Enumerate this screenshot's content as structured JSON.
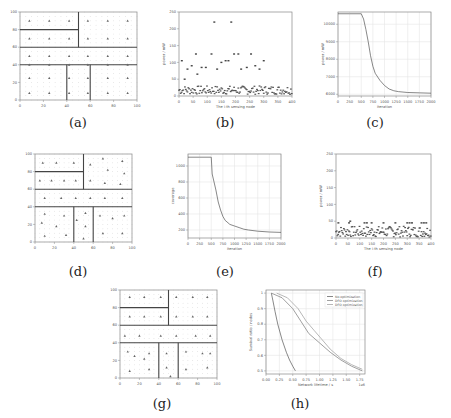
{
  "captions": {
    "a": "(a)",
    "b": "(b)",
    "c": "(c)",
    "d": "(d)",
    "e": "(e)",
    "f": "(f)",
    "g": "(g)",
    "h": "(h)"
  },
  "chart_data": [
    {
      "id": "a",
      "type": "scatter",
      "title": "",
      "xlabel": "",
      "ylabel": "",
      "xlim": [
        0,
        100
      ],
      "ylim": [
        0,
        100
      ],
      "x_ticks": [
        0,
        20,
        40,
        60,
        80,
        100
      ],
      "y_ticks": [
        0,
        20,
        40,
        60,
        80,
        100
      ],
      "grid": "dotted",
      "partition_lines": [
        [
          [
            0,
            60
          ],
          [
            100,
            60
          ]
        ],
        [
          [
            0,
            40
          ],
          [
            100,
            40
          ]
        ],
        [
          [
            50,
            60
          ],
          [
            50,
            100
          ]
        ],
        [
          [
            0,
            80
          ],
          [
            50,
            80
          ]
        ],
        [
          [
            40,
            0
          ],
          [
            40,
            40
          ]
        ],
        [
          [
            60,
            0
          ],
          [
            60,
            40
          ]
        ]
      ],
      "points": [
        [
          8,
          90
        ],
        [
          25,
          90
        ],
        [
          42,
          90
        ],
        [
          58,
          90
        ],
        [
          75,
          90
        ],
        [
          92,
          90
        ],
        [
          8,
          70
        ],
        [
          25,
          70
        ],
        [
          42,
          70
        ],
        [
          58,
          70
        ],
        [
          75,
          70
        ],
        [
          92,
          70
        ],
        [
          8,
          50
        ],
        [
          25,
          50
        ],
        [
          42,
          50
        ],
        [
          58,
          50
        ],
        [
          75,
          50
        ],
        [
          92,
          50
        ],
        [
          8,
          40
        ],
        [
          25,
          40
        ],
        [
          42,
          40
        ],
        [
          58,
          40
        ],
        [
          75,
          40
        ],
        [
          92,
          40
        ],
        [
          8,
          25
        ],
        [
          25,
          25
        ],
        [
          42,
          25
        ],
        [
          58,
          25
        ],
        [
          75,
          25
        ],
        [
          92,
          25
        ],
        [
          8,
          8
        ],
        [
          25,
          8
        ],
        [
          42,
          8
        ],
        [
          58,
          8
        ],
        [
          75,
          8
        ],
        [
          92,
          8
        ]
      ]
    },
    {
      "id": "b",
      "type": "scatter",
      "title": "",
      "xlabel": "The i-th sensing node",
      "ylabel": "power / mW",
      "xlim": [
        0,
        400
      ],
      "ylim": [
        0,
        250
      ],
      "x_ticks": [
        0,
        50,
        100,
        150,
        200,
        250,
        300,
        350,
        400
      ],
      "y_ticks": [
        0,
        50,
        100,
        150,
        200,
        250
      ],
      "grid": false,
      "highlights": [
        [
          10,
          105
        ],
        [
          20,
          50
        ],
        [
          30,
          80
        ],
        [
          45,
          90
        ],
        [
          60,
          125
        ],
        [
          65,
          65
        ],
        [
          80,
          85
        ],
        [
          95,
          85
        ],
        [
          115,
          125
        ],
        [
          125,
          220
        ],
        [
          135,
          80
        ],
        [
          150,
          100
        ],
        [
          165,
          105
        ],
        [
          175,
          105
        ],
        [
          185,
          220
        ],
        [
          195,
          125
        ],
        [
          210,
          125
        ],
        [
          220,
          80
        ],
        [
          240,
          85
        ],
        [
          255,
          125
        ],
        [
          270,
          90
        ],
        [
          285,
          80
        ],
        [
          300,
          105
        ]
      ],
      "baseline_band": [
        5,
        30
      ]
    },
    {
      "id": "c",
      "type": "line",
      "title": "",
      "xlabel": "Iteration",
      "ylabel": "power / mW",
      "xlim": [
        0,
        2000
      ],
      "ylim": [
        5900,
        10700
      ],
      "x_ticks": [
        0,
        250,
        500,
        750,
        1000,
        1250,
        1500,
        1750,
        2000
      ],
      "y_ticks": [
        6000,
        7000,
        8000,
        9000,
        10000
      ],
      "grid": true,
      "x": [
        0,
        250,
        500,
        550,
        600,
        650,
        700,
        750,
        800,
        900,
        1000,
        1100,
        1200,
        1300,
        1500,
        1750,
        2000
      ],
      "values": [
        10600,
        10600,
        10600,
        10300,
        9700,
        9000,
        8200,
        7600,
        7200,
        6800,
        6500,
        6300,
        6200,
        6150,
        6100,
        6080,
        6060
      ]
    },
    {
      "id": "d",
      "type": "scatter",
      "title": "",
      "xlabel": "",
      "ylabel": "",
      "xlim": [
        0,
        100
      ],
      "ylim": [
        0,
        100
      ],
      "x_ticks": [
        0,
        20,
        40,
        60,
        80,
        100
      ],
      "y_ticks": [
        0,
        20,
        40,
        60,
        80,
        100
      ],
      "grid": "dotted",
      "partition_lines": [
        [
          [
            0,
            60
          ],
          [
            100,
            60
          ]
        ],
        [
          [
            0,
            40
          ],
          [
            100,
            40
          ]
        ],
        [
          [
            50,
            60
          ],
          [
            50,
            100
          ]
        ],
        [
          [
            0,
            80
          ],
          [
            50,
            80
          ]
        ],
        [
          [
            40,
            0
          ],
          [
            40,
            40
          ]
        ],
        [
          [
            60,
            0
          ],
          [
            60,
            40
          ]
        ]
      ],
      "points": [
        [
          8,
          90
        ],
        [
          22,
          90
        ],
        [
          40,
          90
        ],
        [
          57,
          88
        ],
        [
          70,
          95
        ],
        [
          75,
          82
        ],
        [
          90,
          92
        ],
        [
          92,
          78
        ],
        [
          88,
          66
        ],
        [
          5,
          70
        ],
        [
          17,
          70
        ],
        [
          30,
          70
        ],
        [
          42,
          70
        ],
        [
          57,
          70
        ],
        [
          72,
          67
        ],
        [
          10,
          50
        ],
        [
          27,
          50
        ],
        [
          42,
          50
        ],
        [
          57,
          50
        ],
        [
          72,
          50
        ],
        [
          90,
          50
        ],
        [
          10,
          32
        ],
        [
          7,
          22
        ],
        [
          22,
          18
        ],
        [
          30,
          30
        ],
        [
          10,
          7
        ],
        [
          32,
          8
        ],
        [
          43,
          25
        ],
        [
          52,
          33
        ],
        [
          52,
          18
        ],
        [
          50,
          4
        ],
        [
          67,
          30
        ],
        [
          70,
          10
        ],
        [
          80,
          27
        ],
        [
          92,
          30
        ],
        [
          90,
          10
        ]
      ]
    },
    {
      "id": "e",
      "type": "line",
      "title": "",
      "xlabel": "Iteration",
      "ylabel": "coverage",
      "xlim": [
        0,
        2000
      ],
      "ylim": [
        100,
        1150
      ],
      "x_ticks": [
        0,
        250,
        500,
        750,
        1000,
        1250,
        1500,
        1750,
        2000
      ],
      "y_ticks": [
        200,
        400,
        600,
        800,
        1000
      ],
      "grid": true,
      "x": [
        0,
        250,
        500,
        520,
        560,
        600,
        650,
        700,
        750,
        800,
        900,
        1000,
        1100,
        1200,
        1300,
        1500,
        1750,
        2000
      ],
      "values": [
        1110,
        1110,
        1110,
        900,
        800,
        700,
        550,
        450,
        370,
        320,
        270,
        250,
        230,
        210,
        200,
        185,
        175,
        170
      ]
    },
    {
      "id": "f",
      "type": "scatter",
      "title": "",
      "xlabel": "The i-th sensing node",
      "ylabel": "power / mW",
      "xlim": [
        0,
        400
      ],
      "ylim": [
        0,
        250
      ],
      "x_ticks": [
        0,
        50,
        100,
        150,
        200,
        250,
        300,
        350,
        400
      ],
      "y_ticks": [
        0,
        50,
        100,
        150,
        200,
        250
      ],
      "grid": false,
      "highlights": [
        [
          10,
          45
        ],
        [
          55,
          45
        ],
        [
          60,
          50
        ],
        [
          120,
          45
        ],
        [
          130,
          45
        ],
        [
          150,
          45
        ],
        [
          200,
          45
        ],
        [
          250,
          45
        ],
        [
          300,
          45
        ],
        [
          310,
          45
        ],
        [
          320,
          45
        ],
        [
          360,
          45
        ],
        [
          370,
          45
        ],
        [
          380,
          45
        ]
      ],
      "baseline_band": [
        3,
        35
      ]
    },
    {
      "id": "g",
      "type": "scatter",
      "title": "",
      "xlabel": "",
      "ylabel": "",
      "xlim": [
        0,
        100
      ],
      "ylim": [
        0,
        100
      ],
      "x_ticks": [
        0,
        20,
        40,
        60,
        80,
        100
      ],
      "y_ticks": [
        0,
        20,
        40,
        60,
        80,
        100
      ],
      "grid": "dotted",
      "partition_lines": [
        [
          [
            0,
            60
          ],
          [
            100,
            60
          ]
        ],
        [
          [
            0,
            40
          ],
          [
            100,
            40
          ]
        ],
        [
          [
            50,
            60
          ],
          [
            50,
            100
          ]
        ],
        [
          [
            0,
            80
          ],
          [
            50,
            80
          ]
        ],
        [
          [
            40,
            0
          ],
          [
            40,
            40
          ]
        ],
        [
          [
            60,
            0
          ],
          [
            60,
            40
          ]
        ]
      ],
      "points": [
        [
          10,
          92
        ],
        [
          25,
          92
        ],
        [
          42,
          92
        ],
        [
          58,
          92
        ],
        [
          75,
          92
        ],
        [
          90,
          92
        ],
        [
          10,
          70
        ],
        [
          25,
          70
        ],
        [
          42,
          70
        ],
        [
          58,
          70
        ],
        [
          75,
          70
        ],
        [
          90,
          70
        ],
        [
          5,
          48
        ],
        [
          20,
          48
        ],
        [
          42,
          48
        ],
        [
          58,
          48
        ],
        [
          78,
          48
        ],
        [
          93,
          48
        ],
        [
          8,
          30
        ],
        [
          15,
          25
        ],
        [
          25,
          22
        ],
        [
          30,
          28
        ],
        [
          10,
          8
        ],
        [
          30,
          10
        ],
        [
          48,
          28
        ],
        [
          48,
          12
        ],
        [
          52,
          2
        ],
        [
          68,
          30
        ],
        [
          68,
          10
        ],
        [
          85,
          28
        ],
        [
          93,
          28
        ],
        [
          90,
          12
        ]
      ]
    },
    {
      "id": "h",
      "type": "line",
      "title": "",
      "xlabel": "Network lifetime / s",
      "ylabel": "Survival ratio / nodes",
      "xlim": [
        0.0,
        1.85
      ],
      "ylim": [
        0.48,
        1.02
      ],
      "x_ticks": [
        0.0,
        0.25,
        0.5,
        0.75,
        1.0,
        1.25,
        1.5,
        1.75
      ],
      "x_tick_labels": [
        "0.00",
        "0.25",
        "0.50",
        "0.75",
        "1.00",
        "1.25",
        "1.50",
        "1.75"
      ],
      "y_ticks": [
        0.5,
        0.6,
        0.7,
        0.8,
        0.9,
        1.0
      ],
      "x_offset_label": "1e6",
      "grid": true,
      "legend_position": "upper right",
      "series": [
        {
          "name": "No optimization",
          "x": [
            0.1,
            0.13,
            0.17,
            0.22,
            0.3,
            0.38,
            0.44,
            0.5,
            0.55
          ],
          "values": [
            1.0,
            0.95,
            0.88,
            0.8,
            0.7,
            0.62,
            0.57,
            0.53,
            0.5
          ]
        },
        {
          "name": "DFO optimization",
          "x": [
            0.1,
            0.3,
            0.5,
            0.65,
            0.8,
            1.0,
            1.2,
            1.4,
            1.6,
            1.8
          ],
          "values": [
            1.0,
            0.97,
            0.9,
            0.82,
            0.74,
            0.68,
            0.62,
            0.57,
            0.53,
            0.5
          ]
        },
        {
          "name": "DFO optimization",
          "x": [
            0.2,
            0.4,
            0.6,
            0.75,
            0.9,
            1.05,
            1.2,
            1.4,
            1.6,
            1.8
          ],
          "values": [
            1.0,
            0.97,
            0.9,
            0.82,
            0.76,
            0.7,
            0.64,
            0.58,
            0.54,
            0.51
          ]
        }
      ]
    }
  ]
}
